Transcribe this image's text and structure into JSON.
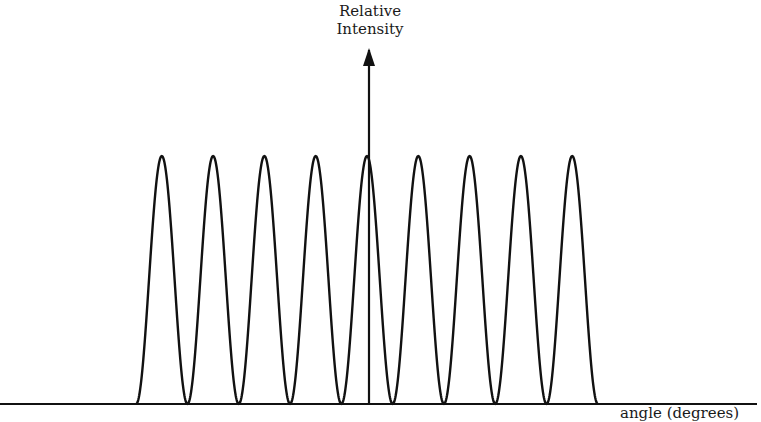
{
  "chart_data": {
    "type": "line",
    "title": "",
    "ylabel": "Relative Intensity",
    "xlabel": "angle (degrees)",
    "num_peaks": 9,
    "peak_relative_height": 1.0,
    "x": [
      -4,
      -3,
      -2,
      -1,
      0,
      1,
      2,
      3,
      4
    ],
    "values": [
      1,
      1,
      1,
      1,
      1,
      1,
      1,
      1,
      1
    ],
    "grid": false,
    "legend": null,
    "ticks": "none"
  },
  "labels": {
    "y_axis_line1": "Relative",
    "y_axis_line2": "Intensity",
    "x_axis": "angle (degrees)"
  },
  "colors": {
    "line": "#111111",
    "background": "#ffffff"
  }
}
